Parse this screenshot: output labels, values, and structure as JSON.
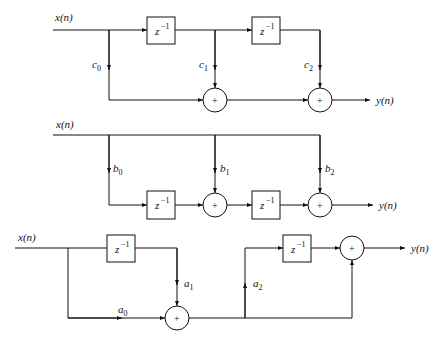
{
  "diagrams": [
    {
      "name": "fir-direct-form",
      "input_label": "x(n)",
      "output_label": "y(n)",
      "delays": [
        "z^-1",
        "z^-1"
      ],
      "coefficients": [
        {
          "base": "c",
          "sub": "0"
        },
        {
          "base": "c",
          "sub": "1"
        },
        {
          "base": "c",
          "sub": "2"
        }
      ],
      "adder_symbol": "+"
    },
    {
      "name": "fir-transposed-form",
      "input_label": "x(n)",
      "output_label": "y(n)",
      "delays": [
        "z^-1",
        "z^-1"
      ],
      "coefficients": [
        {
          "base": "b",
          "sub": "0"
        },
        {
          "base": "b",
          "sub": "1"
        },
        {
          "base": "b",
          "sub": "2"
        }
      ],
      "adder_symbol": "+"
    },
    {
      "name": "fir-cascade-form",
      "input_label": "x(n)",
      "output_label": "y(n)",
      "delays": [
        "z^-1",
        "z^-1"
      ],
      "coefficients": [
        {
          "base": "a",
          "sub": "0"
        },
        {
          "base": "a",
          "sub": "1"
        },
        {
          "base": "a",
          "sub": "2"
        }
      ],
      "adder_symbol": "+"
    }
  ],
  "delay_text": {
    "base": "z",
    "exp": "−1"
  }
}
